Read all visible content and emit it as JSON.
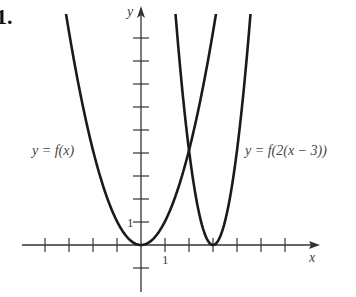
{
  "problem_number": "1.",
  "axes": {
    "x_label": "x",
    "y_label": "y",
    "x_tick_label": "1",
    "y_tick_label": "1",
    "origin_px": [
      141,
      245
    ],
    "unit_px": 24,
    "x_ticks": [
      -4,
      -3,
      -2,
      -1,
      1,
      2,
      3,
      4,
      5,
      6
    ],
    "y_ticks": [
      -1,
      1,
      2,
      3,
      4,
      5,
      6,
      7,
      8,
      9
    ]
  },
  "curves": [
    {
      "name": "f",
      "label": "y = f(x)",
      "vertex": [
        0,
        0
      ]
    },
    {
      "name": "g",
      "label": "y = f(2(x − 3))",
      "vertex": [
        3,
        0
      ]
    }
  ],
  "colors": {
    "curve": "#1a1a1a",
    "axis": "#333333",
    "text": "#444444"
  }
}
